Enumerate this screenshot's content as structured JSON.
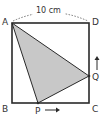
{
  "diagram": {
    "type": "geometry-square",
    "dimension_label": "10 cm",
    "vertices": {
      "A": "A",
      "B": "B",
      "C": "C",
      "D": "D"
    },
    "moving_points": {
      "P": "P",
      "Q": "Q"
    },
    "colors": {
      "stroke": "#2a2a2a",
      "shade": "#c8c8c8",
      "text": "#333333"
    },
    "shaded_region": "triangle APQ",
    "arrows": {
      "P": "right",
      "Q": "up"
    }
  }
}
